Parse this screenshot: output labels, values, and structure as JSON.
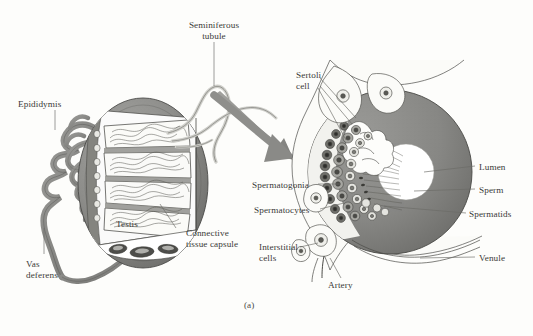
{
  "figure": {
    "caption": "(a)",
    "domain_subject": "testis and seminiferous tubule anatomy",
    "background_color": "#fdfdfb",
    "ink_color": "#3a3a38",
    "tissue_gray": "#8a8a88",
    "tissue_gray_dark": "#6e6e6c",
    "tissue_gray_light": "#b9b9b6",
    "lumen_color": "#ffffff"
  },
  "left_panel": {
    "name": "testis-gross-anatomy",
    "labels": [
      {
        "id": "seminiferous-tubule",
        "text": "Seminiferous\ntubule",
        "x": 186,
        "y": 22,
        "align": "center"
      },
      {
        "id": "epididymis",
        "text": "Epididymis",
        "x": 18,
        "y": 99,
        "align": "left"
      },
      {
        "id": "testis",
        "text": "Testis",
        "x": 116,
        "y": 219,
        "align": "left"
      },
      {
        "id": "connective-tissue-capsule",
        "text": "Connective\ntissue capsule",
        "x": 186,
        "y": 228,
        "align": "left"
      },
      {
        "id": "vas-deferens",
        "text": "Vas\ndeferens",
        "x": 26,
        "y": 259,
        "align": "left"
      }
    ]
  },
  "right_panel": {
    "name": "seminiferous-tubule-cross-section",
    "labels_left": [
      {
        "id": "sertoli-cell",
        "text": "Sertoli\ncell",
        "x": 296,
        "y": 70,
        "align": "left"
      },
      {
        "id": "spermatogonia",
        "text": "Spermatogonia",
        "x": 252,
        "y": 181,
        "align": "left"
      },
      {
        "id": "spermatocytes",
        "text": "Spermatocytes",
        "x": 254,
        "y": 206,
        "align": "left"
      },
      {
        "id": "interstitial-cells",
        "text": "Interstitial\ncells",
        "x": 259,
        "y": 243,
        "align": "left"
      },
      {
        "id": "artery",
        "text": "Artery",
        "x": 328,
        "y": 281,
        "align": "left"
      }
    ],
    "labels_right": [
      {
        "id": "lumen",
        "text": "Lumen",
        "x": 479,
        "y": 163,
        "align": "left"
      },
      {
        "id": "sperm",
        "text": "Sperm",
        "x": 479,
        "y": 186,
        "align": "left"
      },
      {
        "id": "spermatids",
        "text": "Spermatids",
        "x": 469,
        "y": 210,
        "align": "left"
      },
      {
        "id": "venule",
        "text": "Venule",
        "x": 479,
        "y": 254,
        "align": "left"
      }
    ]
  },
  "arrow": {
    "id": "magnification-arrow",
    "description": "thick gray curved arrow from testis to tubule cross-section"
  }
}
